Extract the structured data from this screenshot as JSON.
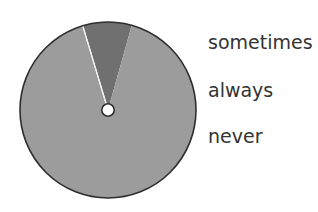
{
  "chart_data": {
    "type": "pie",
    "title": "",
    "categories": [
      "sometimes",
      "always",
      "never"
    ],
    "values": [
      9,
      91,
      0
    ],
    "unit": "%",
    "colors": {
      "sometimes": "#707070",
      "always": "#9c9c9c",
      "never": "#f2f2f2"
    },
    "start_angle_deg": -16.7,
    "legend_position": "right",
    "legend": [
      "sometimes",
      "always",
      "never"
    ],
    "center_hole": true,
    "outline_color": "#2e2e2e"
  },
  "legend": {
    "items": [
      {
        "label": "sometimes"
      },
      {
        "label": "always"
      },
      {
        "label": "never"
      }
    ]
  }
}
